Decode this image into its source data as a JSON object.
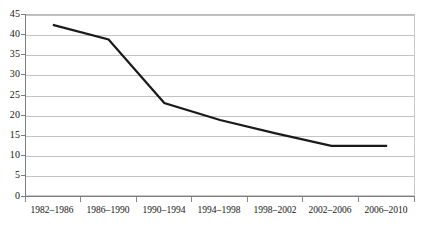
{
  "chart_data": {
    "type": "line",
    "title": "",
    "subtitle": "",
    "xlabel": "",
    "ylabel": "",
    "categories": [
      "1982–1986",
      "1986–1990",
      "1990–1994",
      "1994–1998",
      "1998–2002",
      "2002–2006",
      "2006–2010"
    ],
    "series": [
      {
        "name": "",
        "values": [
          42.3,
          38.7,
          23.0,
          18.8,
          15.5,
          12.4,
          12.4
        ]
      }
    ],
    "ylim": [
      0,
      45
    ],
    "ytick_step": 5,
    "yticks": [
      "45",
      "40",
      "35",
      "30",
      "25",
      "20",
      "15",
      "10",
      "5",
      "0"
    ],
    "grid": "horizontal",
    "legend": "none",
    "line_color": "#1a1a1a",
    "gridline_color": "#c3c3c3",
    "axis_color": "#7d7d7d",
    "background_color": "#ffffff",
    "markers": "none"
  }
}
